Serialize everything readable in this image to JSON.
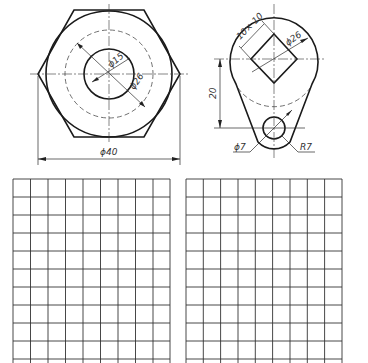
{
  "figure_left": {
    "name": "hex-nut-front-view",
    "dimensions": {
      "inner_diameter": "ϕ15",
      "dashed_diameter": "ϕ26",
      "outer_diameter": "ϕ40"
    }
  },
  "figure_right": {
    "name": "lever-plate",
    "dimensions": {
      "square_hole": "10× 10",
      "large_arc_diameter": "ϕ26",
      "center_distance": "20",
      "small_hole_diameter": "ϕ7",
      "small_arc_radius": "R7"
    }
  },
  "grids": [
    {
      "name": "left-sketch-grid",
      "columns": 9,
      "rows": 10
    },
    {
      "name": "right-sketch-grid",
      "columns": 9,
      "rows": 10
    }
  ],
  "colors": {
    "line": "#1a1a1a",
    "background": "#ffffff"
  }
}
